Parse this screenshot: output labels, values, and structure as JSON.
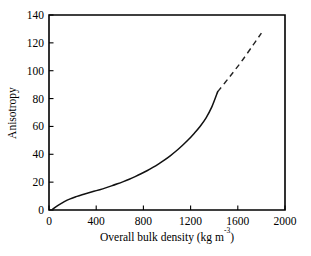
{
  "chart_data": {
    "type": "line",
    "title": "",
    "xlabel": "Overall bulk density (kg m⁻³)",
    "xlabel_base": "Overall bulk density (kg m",
    "xlabel_sup": "-3",
    "xlabel_tail": ")",
    "ylabel": "Anisotropy",
    "xlim": [
      0,
      2000
    ],
    "ylim": [
      0,
      140
    ],
    "xticks": [
      0,
      400,
      800,
      1200,
      1600,
      2000
    ],
    "yticks": [
      0,
      20,
      40,
      60,
      80,
      100,
      120,
      140
    ],
    "xtick_labels": [
      "0",
      "400",
      "800",
      "1200",
      "1600",
      "2000"
    ],
    "ytick_labels": [
      "0",
      "20",
      "40",
      "60",
      "80",
      "100",
      "120",
      "140"
    ],
    "grid": false,
    "legend": null,
    "tick_direction": "in",
    "frame": "box",
    "colors": {
      "curve": "#111111",
      "extrapolation": "#222222",
      "axis": "#000000",
      "background": "#ffffff"
    },
    "series": [
      {
        "name": "Anisotropy vs overall bulk density (measured)",
        "style": "solid",
        "x": [
          30,
          80,
          130,
          180,
          230,
          280,
          330,
          380,
          430,
          480,
          530,
          580,
          630,
          680,
          730,
          780,
          830,
          880,
          930,
          980,
          1030,
          1080,
          1130,
          1180,
          1230,
          1280,
          1330,
          1380,
          1430
        ],
        "y": [
          0.5,
          3.5,
          6.0,
          8.0,
          9.6,
          11.0,
          12.2,
          13.4,
          14.6,
          15.9,
          17.3,
          18.8,
          20.4,
          22.1,
          24.0,
          26.0,
          28.2,
          30.6,
          33.2,
          36.0,
          39.1,
          42.5,
          46.3,
          50.4,
          55.0,
          60.0,
          66.0,
          74.0,
          85.0
        ]
      },
      {
        "name": "Extrapolated trend",
        "style": "dashed",
        "x": [
          1430,
          1530,
          1630,
          1730,
          1800
        ],
        "y": [
          85.0,
          95.5,
          106.5,
          118.5,
          127.0
        ]
      }
    ],
    "annotations": []
  },
  "geometry": {
    "plot_left_px": 49,
    "plot_right_px": 285,
    "plot_top_px": 15,
    "plot_bottom_px": 210
  }
}
